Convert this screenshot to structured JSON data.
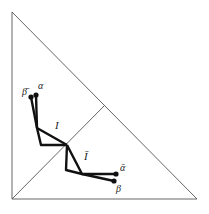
{
  "diagram": {
    "labels": {
      "beta_bar": "β̄",
      "alpha": "α",
      "I": "I",
      "I_bar": "Ī",
      "alpha_bar": "ᾱ",
      "beta": "β"
    },
    "colors": {
      "frame": "#555555",
      "path": "#111111",
      "background": "#ffffff"
    }
  }
}
